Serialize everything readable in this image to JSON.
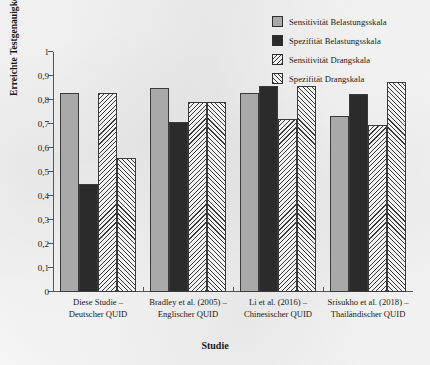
{
  "chart_data": {
    "type": "bar",
    "title": "",
    "xlabel": "Studie",
    "ylabel": "Erreichte Testgenauigkeit",
    "ylim": [
      0,
      1
    ],
    "grid": false,
    "legend_position": "top-right",
    "categories": [
      "Diese Studie – Deutscher QUID",
      "Bradley et al. (2005) – Englischer QUID",
      "Li et al. (2016) – Chinesischer QUID",
      "Srisukho et al. (2018) – Thailändischer QUID"
    ],
    "category_lines": [
      [
        "Diese Studie –",
        "Deutscher QUID"
      ],
      [
        "Bradley et al. (2005) –",
        "Englischer QUID"
      ],
      [
        "Li et al. (2016) –",
        "Chinesischer QUID"
      ],
      [
        "Srisukho et al. (2018) –",
        "Thailändischer QUID"
      ]
    ],
    "ytick_labels": [
      "0",
      "0,1",
      "0,2",
      "0,3",
      "0,4",
      "0,5",
      "0,6",
      "0,7",
      "0,8",
      "0,9",
      "1"
    ],
    "ytick_values": [
      0,
      0.1,
      0.2,
      0.3,
      0.4,
      0.5,
      0.6,
      0.7,
      0.8,
      0.9,
      1
    ],
    "series": [
      {
        "name": "Sensitivität Belastungsskala",
        "fill": "solid-gray",
        "color": "#a9a9a9",
        "values": [
          0.83,
          0.85,
          0.83,
          0.735
        ]
      },
      {
        "name": "Spezifität Belastungsskala",
        "fill": "solid-dark",
        "color": "#2b2b2b",
        "values": [
          0.45,
          0.71,
          0.86,
          0.825
        ]
      },
      {
        "name": "Sensitivität Drangskala",
        "fill": "hatch-back",
        "color": "#f2f2f2",
        "values": [
          0.83,
          0.79,
          0.72,
          0.695
        ]
      },
      {
        "name": "Spezifität Drangskala",
        "fill": "hatch-fwd",
        "color": "#f2f2f2",
        "values": [
          0.56,
          0.79,
          0.86,
          0.875
        ]
      }
    ]
  }
}
